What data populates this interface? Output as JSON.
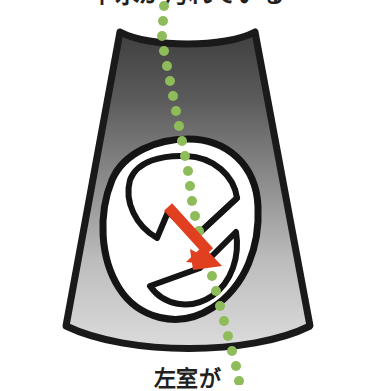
{
  "figure": {
    "kind": "ultrasound-schematic",
    "caption_top": "羊水が汚れている",
    "caption_bottom": "左室が",
    "background_color": "#ffffff",
    "ink_color": "#231f20"
  },
  "scan_sector": {
    "label": "ultrasound scan sector",
    "outline_color": "#1a1a1a",
    "outline_width": 7,
    "gradient_top_color": "#4a4a4a",
    "gradient_mid_color": "#8c8c8c",
    "gradient_bottom_color": "#d6d6d6",
    "top_edge": "concave",
    "bottom_edge": "convex-arc"
  },
  "anatomy": {
    "label": "fetal head cross-section",
    "fill_color": "#ffffff",
    "stroke_color": "#1a1a1a",
    "structures": [
      {
        "name": "outer-skull-outline",
        "stroke_width": 7
      },
      {
        "name": "upper-ventricle-outline",
        "stroke_width": 6
      },
      {
        "name": "lower-ventricle-outline",
        "stroke_width": 6
      },
      {
        "name": "midline-echo",
        "stroke_width": 6
      }
    ]
  },
  "arrow": {
    "label": "pointer arrow",
    "color": "#e0401f",
    "direction": "down-right",
    "shaft_width": 11,
    "from": {
      "x": 169,
      "y": 208
    },
    "to": {
      "x": 219,
      "y": 262
    }
  },
  "dotted_path": {
    "label": "green dotted measurement line",
    "color": "#8fbc5a",
    "dot_radius": 5,
    "dot_count": 23,
    "points": [
      {
        "x": 164,
        "y": 6
      },
      {
        "x": 163,
        "y": 21
      },
      {
        "x": 162,
        "y": 36
      },
      {
        "x": 164,
        "y": 51
      },
      {
        "x": 167,
        "y": 66
      },
      {
        "x": 170,
        "y": 81
      },
      {
        "x": 173,
        "y": 96
      },
      {
        "x": 176,
        "y": 111
      },
      {
        "x": 179,
        "y": 126
      },
      {
        "x": 182,
        "y": 141
      },
      {
        "x": 185,
        "y": 156
      },
      {
        "x": 188,
        "y": 171
      },
      {
        "x": 190,
        "y": 186
      },
      {
        "x": 192,
        "y": 201
      },
      {
        "x": 195,
        "y": 216
      },
      {
        "x": 199,
        "y": 231
      },
      {
        "x": 203,
        "y": 246
      },
      {
        "x": 207,
        "y": 261
      },
      {
        "x": 212,
        "y": 276
      },
      {
        "x": 216,
        "y": 291
      },
      {
        "x": 220,
        "y": 306
      },
      {
        "x": 224,
        "y": 321
      },
      {
        "x": 228,
        "y": 336
      },
      {
        "x": 232,
        "y": 351
      },
      {
        "x": 236,
        "y": 366
      },
      {
        "x": 239,
        "y": 381
      }
    ]
  }
}
